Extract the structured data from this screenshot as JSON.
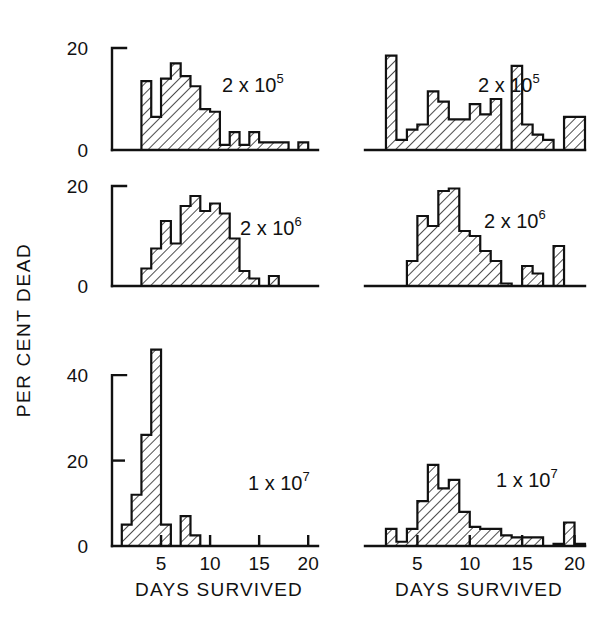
{
  "figure": {
    "y_axis_title": "PER CENT DEAD",
    "x_axis_title": "DAYS SURVIVED"
  },
  "chart_data": [
    {
      "type": "bar",
      "panel": "top-left",
      "title": "2 x 10",
      "exponent": "5",
      "xlabel": "DAYS SURVIVED",
      "ylabel": "PER CENT DEAD",
      "xlim": [
        0,
        21
      ],
      "ylim": [
        0,
        20
      ],
      "yticks": [
        0,
        20
      ],
      "ytick_labels": [
        "0",
        "20"
      ],
      "xticks": [
        5,
        10,
        15,
        20
      ],
      "bin_width": 1,
      "x": [
        3,
        4,
        5,
        6,
        7,
        8,
        9,
        10,
        11,
        12,
        13,
        14,
        15,
        16,
        17,
        18,
        19,
        20
      ],
      "values": [
        13.5,
        6.5,
        14.0,
        17.0,
        14.5,
        12.5,
        8.0,
        7.5,
        1.0,
        3.5,
        1.0,
        3.5,
        1.5,
        1.5,
        1.5,
        0.0,
        1.5,
        0.0
      ]
    },
    {
      "type": "bar",
      "panel": "top-right",
      "title": "2 x 10",
      "exponent": "5",
      "xlabel": "DAYS SURVIVED",
      "ylabel": "PER CENT DEAD",
      "xlim": [
        0,
        21
      ],
      "ylim": [
        0,
        20
      ],
      "yticks": [
        0,
        20
      ],
      "ytick_labels": [
        "0",
        "20"
      ],
      "xticks": [
        5,
        10,
        15,
        20
      ],
      "bin_width": 1,
      "x": [
        2,
        3,
        4,
        5,
        6,
        7,
        8,
        9,
        10,
        11,
        12,
        13,
        14,
        15,
        16,
        17,
        18,
        19,
        20
      ],
      "values": [
        18.5,
        2.0,
        4.0,
        5.0,
        11.5,
        9.5,
        6.0,
        6.0,
        9.0,
        7.0,
        10.0,
        0.0,
        16.5,
        5.0,
        3.0,
        2.0,
        0.0,
        6.5,
        6.5
      ]
    },
    {
      "type": "bar",
      "panel": "middle-left",
      "title": "2 x 10",
      "exponent": "6",
      "xlabel": "DAYS SURVIVED",
      "ylabel": "PER CENT DEAD",
      "xlim": [
        0,
        21
      ],
      "ylim": [
        0,
        20
      ],
      "yticks": [
        0,
        20
      ],
      "ytick_labels": [
        "0",
        "20"
      ],
      "xticks": [
        5,
        10,
        15,
        20
      ],
      "bin_width": 1,
      "x": [
        3,
        4,
        5,
        6,
        7,
        8,
        9,
        10,
        11,
        12,
        13,
        14,
        15,
        16,
        17,
        18,
        19,
        20
      ],
      "values": [
        3.5,
        7.5,
        13.0,
        8.5,
        16.0,
        18.0,
        15.0,
        16.5,
        14.5,
        9.5,
        3.0,
        1.5,
        0.0,
        2.0,
        0.0,
        0.0,
        0.0,
        0.0
      ]
    },
    {
      "type": "bar",
      "panel": "middle-right",
      "title": "2 x 10",
      "exponent": "6",
      "xlabel": "DAYS SURVIVED",
      "ylabel": "PER CENT DEAD",
      "xlim": [
        0,
        21
      ],
      "ylim": [
        0,
        20
      ],
      "yticks": [
        0,
        20
      ],
      "ytick_labels": [
        "0",
        "20"
      ],
      "xticks": [
        5,
        10,
        15,
        20
      ],
      "bin_width": 1,
      "x": [
        4,
        5,
        6,
        7,
        8,
        9,
        10,
        11,
        12,
        13,
        14,
        15,
        16,
        17,
        18,
        19
      ],
      "values": [
        5.0,
        14.0,
        12.0,
        19.0,
        19.5,
        11.0,
        10.0,
        7.0,
        5.0,
        0.5,
        0.0,
        4.0,
        2.5,
        0.0,
        8.0,
        0.0
      ]
    },
    {
      "type": "bar",
      "panel": "bottom-left",
      "title": "1 x 10",
      "exponent": "7",
      "xlabel": "DAYS SURVIVED",
      "ylabel": "PER CENT DEAD",
      "xlim": [
        0,
        21
      ],
      "ylim": [
        0,
        48
      ],
      "yticks": [
        0,
        20,
        40
      ],
      "ytick_labels": [
        "0",
        "20",
        "40"
      ],
      "xticks": [
        5,
        10,
        15,
        20
      ],
      "bin_width": 1,
      "x": [
        1,
        2,
        3,
        4,
        5,
        6,
        7,
        8,
        9,
        10,
        11,
        12,
        13,
        14,
        15,
        16,
        17,
        18,
        19,
        20
      ],
      "values": [
        5.0,
        12.0,
        26.0,
        46.0,
        5.0,
        0.0,
        7.0,
        2.5,
        0.0,
        0.0,
        0.0,
        0.0,
        0.0,
        0.0,
        0.0,
        0.0,
        0.0,
        0.0,
        0.0,
        0.0
      ]
    },
    {
      "type": "bar",
      "panel": "bottom-right",
      "title": "1 x 10",
      "exponent": "7",
      "xlabel": "DAYS SURVIVED",
      "ylabel": "PER CENT DEAD",
      "xlim": [
        0,
        21
      ],
      "ylim": [
        0,
        48
      ],
      "yticks": [
        0,
        20,
        40
      ],
      "ytick_labels": [
        "0",
        "20",
        "40"
      ],
      "xticks": [
        5,
        10,
        15,
        20
      ],
      "bin_width": 1,
      "x": [
        2,
        3,
        4,
        5,
        6,
        7,
        8,
        9,
        10,
        11,
        12,
        13,
        14,
        15,
        16,
        17,
        18,
        19,
        20
      ],
      "values": [
        4.0,
        1.0,
        4.0,
        10.5,
        19.0,
        13.5,
        15.5,
        8.0,
        4.5,
        4.0,
        4.0,
        2.5,
        2.0,
        2.0,
        2.0,
        0.0,
        0.5,
        5.5,
        0.5
      ]
    }
  ]
}
